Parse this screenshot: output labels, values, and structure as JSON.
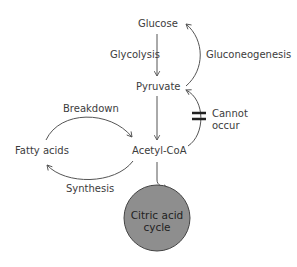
{
  "nodes": {
    "glucose": "Glucose",
    "pyruvate": "Pyruvate",
    "acetyl_coa": "Acetyl-CoA",
    "fatty_acids": "Fatty acids",
    "citric_acid_cycle_line1": "Citric acid",
    "citric_acid_cycle_line2": "cycle"
  },
  "edges": {
    "glycolysis": "Glycolysis",
    "gluconeogenesis": "Gluconeogenesis",
    "breakdown": "Breakdown",
    "synthesis": "Synthesis",
    "cannot_occur_line1": "Cannot",
    "cannot_occur_line2": "occur"
  },
  "colors": {
    "circle_fill": "#8e8e8e",
    "line": "#555555",
    "text": "#3c3c3c"
  }
}
